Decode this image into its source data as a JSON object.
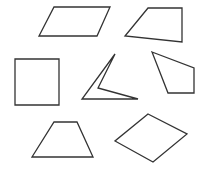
{
  "canvas": {
    "width": 206,
    "height": 171,
    "background": "#ffffff",
    "stroke_color": "#333333"
  },
  "shapes": [
    {
      "id": "parallelogram",
      "label": "parallelogram",
      "points": "54,7 110,7 97,36 39,36"
    },
    {
      "id": "right-trapezoid",
      "label": "right trapezoid",
      "points": "148,8 182,8 182,42 125,36"
    },
    {
      "id": "square",
      "label": "square",
      "points": "15,59 59,59 59,105 15,105"
    },
    {
      "id": "concave-quadrilateral",
      "label": "concave quadrilateral (arrowhead)",
      "points": "115,54 98,88 138,99 82,99"
    },
    {
      "id": "irregular-quadrilateral",
      "label": "irregular quadrilateral",
      "points": "152,52 194,68 194,93 168,93"
    },
    {
      "id": "isosceles-trapezoid",
      "label": "isosceles trapezoid",
      "points": "54,122 77,122 93,157 32,157"
    },
    {
      "id": "rhombus",
      "label": "rhombus",
      "points": "148,114 187,134 153,162 115,141"
    }
  ]
}
